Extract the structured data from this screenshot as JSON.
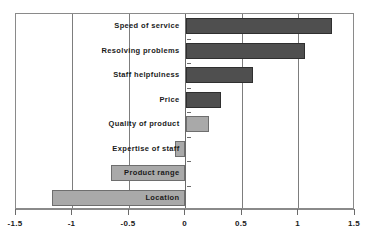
{
  "chart_data": {
    "type": "bar",
    "orientation": "horizontal",
    "title": "",
    "xlabel": "",
    "ylabel": "",
    "xlim": [
      -1.5,
      1.5
    ],
    "xticks": [
      -1.5,
      -1,
      -0.5,
      0,
      0.5,
      1,
      1.5
    ],
    "xtick_labels": [
      "-1.5",
      "-1",
      "-0.5",
      "0",
      "0.5",
      "1",
      "1.5"
    ],
    "grid": true,
    "legend": null,
    "categories": [
      "Speed of service",
      "Resolving problems",
      "Staff helpfulness",
      "Price",
      "Quality of product",
      "Expertise of staff",
      "Product range",
      "Location"
    ],
    "values": [
      1.3,
      1.06,
      0.6,
      0.31,
      0.21,
      -0.09,
      -0.66,
      -1.18
    ],
    "colors": [
      "#4f4f4f",
      "#4f4f4f",
      "#4f4f4f",
      "#4f4f4f",
      "#a9a9a9",
      "#a9a9a9",
      "#a9a9a9",
      "#a9a9a9"
    ],
    "bars": [
      {
        "label": "Speed of service",
        "value": 1.3,
        "shade": "dark"
      },
      {
        "label": "Resolving problems",
        "value": 1.06,
        "shade": "dark"
      },
      {
        "label": "Staff helpfulness",
        "value": 0.6,
        "shade": "dark"
      },
      {
        "label": "Price",
        "value": 0.31,
        "shade": "dark"
      },
      {
        "label": "Quality of product",
        "value": 0.21,
        "shade": "light"
      },
      {
        "label": "Expertise of staff",
        "value": -0.09,
        "shade": "light"
      },
      {
        "label": "Product range",
        "value": -0.66,
        "shade": "light"
      },
      {
        "label": "Location",
        "value": -1.18,
        "shade": "light"
      }
    ],
    "palette": {
      "dark_bar": "#4f4f4f",
      "light_bar": "#a9a9a9",
      "bar_border": "#4a4a4a",
      "axis": "#8a8a8a",
      "gridline": "#7d7d7d",
      "text": "#1a1a1a",
      "background": "#ffffff"
    }
  }
}
